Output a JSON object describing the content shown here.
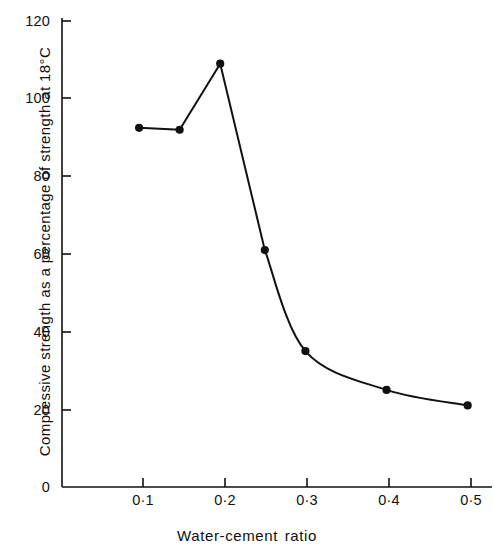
{
  "chart_data": {
    "type": "line",
    "title": "",
    "xlabel": "Water-cement ratio",
    "ylabel": "Compressive strength as a percentage of strength at 18°C",
    "xlim": [
      0.0,
      0.53
    ],
    "ylim": [
      0,
      125
    ],
    "grid": false,
    "legend": null,
    "marker": "filled-circle",
    "x_tick_labels": [
      "0·1",
      "0·2",
      "0·3",
      "0·4",
      "0·5"
    ],
    "x_ticks": [
      0.1,
      0.2,
      0.3,
      0.4,
      0.5
    ],
    "y_tick_labels": [
      "0",
      "20",
      "40",
      "60",
      "80",
      "100",
      "120"
    ],
    "y_ticks": [
      0,
      20,
      40,
      60,
      80,
      100,
      120
    ],
    "series": [
      {
        "name": "Compressive strength",
        "x": [
          0.095,
          0.145,
          0.195,
          0.25,
          0.3,
          0.4,
          0.5
        ],
        "values": [
          92.5,
          92.0,
          109.0,
          61.0,
          35.0,
          25.0,
          21.0
        ]
      }
    ],
    "line_color": "#111111",
    "marker_color": "#111111",
    "axis_color": "#111111"
  }
}
